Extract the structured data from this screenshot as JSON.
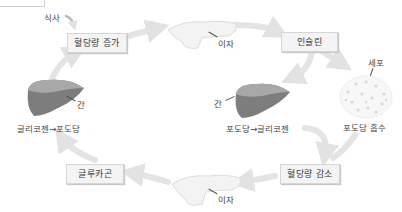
{
  "diagram": {
    "title_box_partial": "",
    "nodes": {
      "meal": "식사",
      "blood_sugar_up": "혈당량 증가",
      "pancreas_top_label": "이자",
      "insulin": "인슐린",
      "cell_label": "세포",
      "glucose_absorb": "포도당 흡수",
      "liver_right_label": "간",
      "glucose_to_glycogen": "포도당→글리코젠",
      "blood_sugar_down": "혈당량 감소",
      "pancreas_bottom_label": "이자",
      "glucagon": "글루카곤",
      "liver_left_label": "간",
      "glycogen_to_glucose": "글리코젠→포도당"
    },
    "colors": {
      "arrow": "#e2e2e2",
      "box_bg": "#f4f4f4",
      "box_border": "#d6d6d6",
      "liver": "#7a7a7a",
      "pancreas": "#f0f0f0"
    }
  }
}
